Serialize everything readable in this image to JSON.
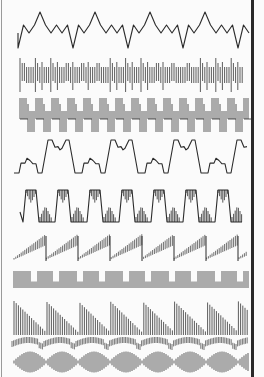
{
  "figure": {
    "ink_color": "#2b2b2b",
    "background": "#fbfbfb",
    "trace_count": 10
  },
  "traces": [
    {
      "id": 1,
      "kind": "zigzag-with-spikes",
      "y_center": 33,
      "x0": 18,
      "x1": 252,
      "period": 55,
      "amplitude": 8,
      "spike_height": 21,
      "dip_depth": 15
    },
    {
      "id": 2,
      "kind": "comb-bursts",
      "y_top": 58,
      "y_bottom": 92,
      "x0": 20,
      "x1": 243,
      "period": 15,
      "line_spacing": 2.2
    },
    {
      "id": 3,
      "kind": "stepped-comb-square",
      "y_top": 98,
      "y_bottom": 132,
      "x0": 20,
      "x1": 248,
      "period": 16,
      "line_spacing": 2.0
    },
    {
      "id": 4,
      "kind": "trapezoid-with-steps",
      "y_top": 140,
      "y_bottom": 173,
      "x0": 14,
      "x1": 248,
      "period": 63
    },
    {
      "id": 5,
      "kind": "square-with-filled-transients",
      "y_top": 190,
      "y_bottom": 222,
      "x0": 20,
      "x1": 242,
      "period": 32
    },
    {
      "id": 6,
      "kind": "sawtooth-up-comb",
      "y_center": 250,
      "x0": 14,
      "x1": 248,
      "period": 32,
      "amplitude": 9
    },
    {
      "id": 7,
      "kind": "comb-square",
      "y_top": 271,
      "y_bottom": 288,
      "x0": 14,
      "x1": 248,
      "period": 23,
      "line_spacing": 2.0
    },
    {
      "id": 8,
      "kind": "sawtooth-down-comb",
      "y_top": 301,
      "y_bottom": 335,
      "x0": 14,
      "x1": 248,
      "period": 32,
      "line_spacing": 2.2
    },
    {
      "id": 9,
      "kind": "wavy-comb",
      "y_center": 344,
      "x0": 12,
      "x1": 248,
      "period": 32,
      "amplitude": 4,
      "half_height": 5
    },
    {
      "id": 10,
      "kind": "beating-envelope-comb",
      "y_center": 362,
      "x0": 14,
      "x1": 248,
      "period": 32,
      "half_height": 9,
      "line_spacing": 2.0
    }
  ]
}
